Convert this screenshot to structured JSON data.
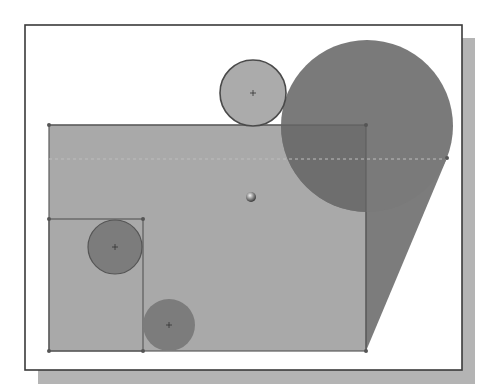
{
  "diagram": {
    "colors": {
      "background": "#ffffff",
      "frame_border": "#3a3a3a",
      "shadow": "#b4b4b4",
      "light_fill": "#a9a9a9",
      "dark_fill": "#7a7a7a",
      "overlap_fill": "#6e6e6e",
      "edge": "#555555",
      "dashed": "#bdbdbd"
    },
    "frame": {
      "x": 25,
      "y": 25,
      "width": 437,
      "height": 345
    },
    "shadow": {
      "x": 38,
      "y": 38,
      "width": 437,
      "height": 346
    },
    "main_rectangle": {
      "x": 49,
      "y": 125,
      "width": 317,
      "height": 226
    },
    "inner_rectangle": {
      "x": 49,
      "y": 219,
      "width": 94,
      "height": 132
    },
    "circles": [
      {
        "name": "top-small-circle",
        "cx": 253,
        "cy": 93,
        "r": 33,
        "fill": "light",
        "center_mark": true
      },
      {
        "name": "large-circle",
        "cx": 367,
        "cy": 126,
        "r": 86,
        "fill": "dark",
        "center_mark": false
      },
      {
        "name": "inner-left-circle",
        "cx": 115,
        "cy": 247,
        "r": 27,
        "fill": "dark",
        "center_mark": true
      },
      {
        "name": "bottom-circle",
        "cx": 169,
        "cy": 325,
        "r": 26,
        "fill": "dark",
        "center_mark": true
      }
    ],
    "tangent_region": {
      "points": [
        [
          366,
          158
        ],
        [
          447,
          158
        ],
        [
          366,
          351
        ]
      ]
    },
    "dashed_line": {
      "y": 159,
      "x1": 49,
      "x2": 447
    },
    "origin_marker": {
      "cx": 251,
      "cy": 197,
      "r": 5
    },
    "vertices": [
      [
        49,
        125
      ],
      [
        366,
        125
      ],
      [
        49,
        219
      ],
      [
        143,
        219
      ],
      [
        49,
        351
      ],
      [
        143,
        351
      ],
      [
        366,
        351
      ],
      [
        447,
        158
      ]
    ]
  }
}
